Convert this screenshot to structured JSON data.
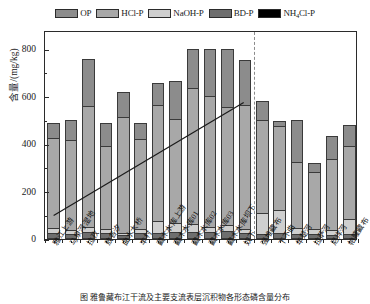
{
  "legend": {
    "position": "top-center",
    "items": [
      {
        "label": "OP",
        "color": "#8c8c8c",
        "icon": "legend-swatch-op"
      },
      {
        "label": "HCl-P",
        "color": "#a8a8a8",
        "icon": "legend-swatch-hcl-p"
      },
      {
        "label": "NaOH-P",
        "color": "#cfcfcf",
        "icon": "legend-swatch-naoh-p"
      },
      {
        "label": "BD-P",
        "color": "#6e6e6e",
        "icon": "legend-swatch-bd-p"
      },
      {
        "label": "NH4Cl-P",
        "label_main": "NH",
        "label_sub": "4",
        "label_tail": "Cl-P",
        "color": "#000000",
        "icon": "legend-swatch-nh4cl-p"
      }
    ]
  },
  "axes": {
    "ylabel": "含量/(mg/kg)",
    "yticks": [
      0,
      200,
      400,
      600,
      800
    ],
    "ytick_labels": [
      "0",
      "200",
      "400",
      "600",
      "800"
    ],
    "ylim": [
      0,
      880
    ],
    "xlabel": "",
    "grid": false
  },
  "annotations": {
    "divider_note": "dashed vertical separator between mainstem and tributary sites",
    "trendline_note": "solid rising trend line across mainstem sites"
  },
  "caption": "图  雅鲁藏布江干流及主要支流表层沉积物各形态磷含量分布",
  "chart_data": {
    "type": "bar",
    "stacked": true,
    "title": "",
    "xlabel": "",
    "ylabel": "含量/(mg/kg)",
    "ylim": [
      0,
      880
    ],
    "yticks": [
      0,
      200,
      400,
      600,
      800
    ],
    "legend_position": "top-center",
    "categories": [
      "雅江上游",
      "马泉河湿地",
      "拉孜",
      "敖各汐",
      "曲水大桥",
      "丰村",
      "藏木水库上游",
      "藏木水库01",
      "藏木水库02",
      "藏木水库03",
      "藏木水库坝下",
      "奴下",
      "强堆藏布",
      "下不曲",
      "年楚河",
      "拉萨河",
      "尼洋河",
      "帕隆藏布"
    ],
    "series": [
      {
        "name": "NH4Cl-P",
        "color": "#000000",
        "values": [
          4,
          4,
          5,
          4,
          4,
          4,
          5,
          6,
          6,
          6,
          6,
          5,
          4,
          4,
          4,
          4,
          3,
          4
        ]
      },
      {
        "name": "BD-P",
        "color": "#6e6e6e",
        "values": [
          22,
          18,
          24,
          20,
          12,
          22,
          20,
          24,
          24,
          22,
          28,
          20,
          18,
          20,
          18,
          16,
          14,
          18
        ]
      },
      {
        "name": "NaOH-P",
        "color": "#cfcfcf",
        "values": [
          20,
          14,
          22,
          18,
          10,
          16,
          50,
          36,
          34,
          22,
          24,
          18,
          86,
          100,
          24,
          24,
          18,
          60
        ]
      },
      {
        "name": "HCl-P",
        "color": "#a8a8a8",
        "values": [
          378,
          382,
          510,
          348,
          488,
          380,
          490,
          440,
          570,
          552,
          500,
          520,
          392,
          350,
          280,
          240,
          300,
          310
        ]
      },
      {
        "name": "OP",
        "color": "#8c8c8c",
        "values": [
          66,
          82,
          196,
          100,
          106,
          68,
          90,
          160,
          166,
          198,
          242,
          190,
          82,
          22,
          174,
          36,
          96,
          86
        ]
      }
    ],
    "totals": [
      490,
      500,
      757,
      490,
      620,
      490,
      655,
      666,
      800,
      800,
      800,
      753,
      582,
      496,
      500,
      320,
      431,
      478
    ],
    "trendline": {
      "x_start": "雅江上游",
      "y_start": 100,
      "x_end": "奴下",
      "y_end": 580
    },
    "divider_after_category": "奴下"
  }
}
